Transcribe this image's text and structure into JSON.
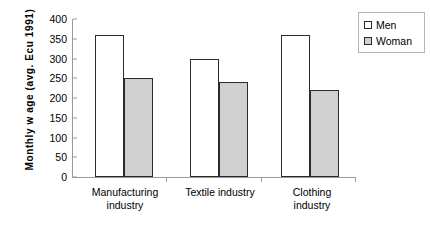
{
  "chart_data": {
    "type": "bar",
    "title": "",
    "xlabel": "",
    "ylabel": "Monthly w age (avg. Ecu 1991)",
    "categories": [
      "Manufacturing\nindustry",
      "Textile industry",
      "Clothing\nindustry"
    ],
    "series": [
      {
        "name": "Men",
        "values": [
          360,
          300,
          360
        ],
        "color": "#ffffff"
      },
      {
        "name": "Woman",
        "values": [
          250,
          240,
          220
        ],
        "color": "#d0d0d0"
      }
    ],
    "ylim": [
      0,
      400
    ],
    "yticks": [
      400,
      350,
      300,
      250,
      200,
      150,
      100,
      50,
      0
    ],
    "ytick_labels": [
      "400",
      "350",
      "300",
      "250",
      "200",
      "150",
      "100",
      "50",
      "0"
    ],
    "grid": false,
    "legend_position": "top-right"
  },
  "legend": {
    "entries": [
      {
        "label": "Men"
      },
      {
        "label": "Woman"
      }
    ]
  },
  "colors": {
    "men_fill": "#ffffff",
    "woman_fill": "#d0d0d0",
    "bar_border": "#2b2b2b",
    "axis": "#9a9a9a",
    "text": "#000000"
  }
}
